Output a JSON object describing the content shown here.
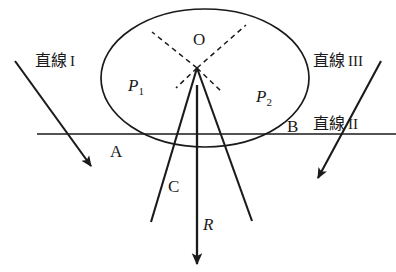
{
  "figure": {
    "background_color": "#ffffff",
    "stroke_color": "#1a1a1a",
    "width": 396,
    "height": 272
  },
  "labels": {
    "center_point": "O",
    "point_a": "A",
    "point_b": "B",
    "point_c": "C",
    "ray_r": "R",
    "p1": "P",
    "p1_sub": "1",
    "p2": "P",
    "p2_sub": "2",
    "line_1_jp": "直線",
    "line_1_num": "I",
    "line_2_jp": "直線",
    "line_2_num": "II",
    "line_3_jp": "直線",
    "line_3_num": "III"
  },
  "geometry": {
    "ellipse": {
      "cx": 205,
      "cy": 78,
      "rx": 104,
      "ry": 69
    },
    "center": {
      "x": 197,
      "y": 68
    },
    "point_a": {
      "x": 119,
      "y": 135
    },
    "point_b": {
      "x": 272,
      "y": 134
    },
    "point_c": {
      "x": 197,
      "y": 190
    },
    "line_ii": {
      "x1": 37,
      "y1": 134,
      "x2": 396,
      "y2": 134
    },
    "line_i": {
      "x1": 15,
      "y1": 61,
      "x2": 88,
      "y2": 163
    },
    "line_iii": {
      "x1": 381,
      "y1": 61,
      "x2": 321,
      "y2": 181
    },
    "ray_r": {
      "x1": 197,
      "y1": 85,
      "x2": 197,
      "y2": 261
    },
    "segment_p1": {
      "x1": 197,
      "y1": 68,
      "x2": 252,
      "y2": 221
    },
    "segment_p2": {
      "x1": 197,
      "y1": 68,
      "x2": 151,
      "y2": 222
    }
  }
}
